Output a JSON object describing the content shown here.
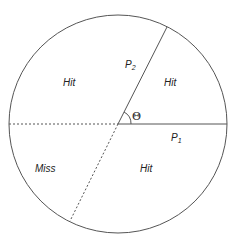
{
  "diagram": {
    "regions": {
      "upper_left": "Hit",
      "upper_right": "Hit",
      "lower_left": "Miss",
      "lower_right": "Hit"
    },
    "labels": {
      "p2": "P",
      "p2_sub": "2",
      "p1": "P",
      "p1_sub": "1",
      "theta": "Θ"
    },
    "colors": {
      "stroke": "#555555",
      "text": "#222222"
    }
  }
}
